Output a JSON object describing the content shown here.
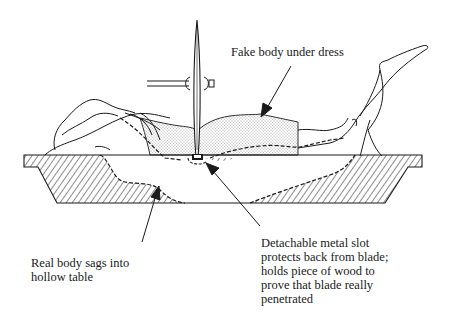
{
  "labels": {
    "fake_body": "Fake body under dress",
    "real_body_line1": "Real body sags into",
    "real_body_line2": "hollow table",
    "slot_line1": "Detachable metal slot",
    "slot_line2": "protects back from blade;",
    "slot_line3": "holds piece of wood to",
    "slot_line4": "prove that blade really",
    "slot_line5": "penetrated"
  },
  "colors": {
    "ink": "#1a1a1a",
    "background": "#ffffff"
  }
}
